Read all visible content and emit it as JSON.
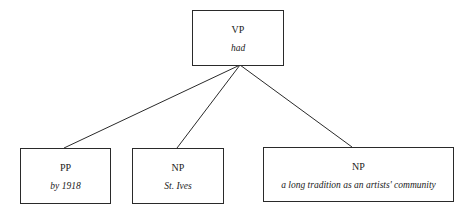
{
  "tree": {
    "root": {
      "category": "VP",
      "word": "had"
    },
    "children": [
      {
        "category": "PP",
        "word": "by 1918"
      },
      {
        "category": "NP",
        "word": "St. Ives"
      },
      {
        "category": "NP",
        "word": "a long tradition as an artists' community"
      }
    ]
  },
  "colors": {
    "border": "#2a2a2a",
    "line": "#2a2a2a",
    "text": "#222222",
    "background": "#ffffff"
  }
}
